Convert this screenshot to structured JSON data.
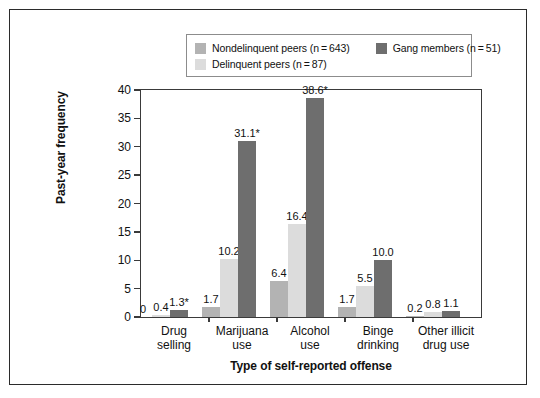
{
  "figure": {
    "border_color": "#2b2b2b",
    "background": "#ffffff"
  },
  "legend": {
    "position": "top-center",
    "entries": [
      {
        "label": "Nondelinquent peers (n = 643)",
        "name": "Nondelinquent peers",
        "n": 643,
        "color": "#b3b3b3"
      },
      {
        "label": "Delinquent peers (n = 87)",
        "name": "Delinquent peers",
        "n": 87,
        "color": "#dcdcdc"
      },
      {
        "label": "Gang members (n = 51)",
        "name": "Gang members",
        "n": 51,
        "color": "#6e6e6e"
      }
    ]
  },
  "chart_data": {
    "type": "bar",
    "title": "",
    "xlabel": "Type of self-reported offense",
    "ylabel": "Past-year frequency",
    "ylim": [
      0,
      40
    ],
    "yticks": [
      0,
      5,
      10,
      15,
      20,
      25,
      30,
      35,
      40
    ],
    "ytick_labels": [
      "0",
      "5",
      "10",
      "15",
      "20",
      "25",
      "30",
      "35",
      "40"
    ],
    "grid": false,
    "legend_position": "top-center",
    "categories": [
      "Drug selling",
      "Marijuana use",
      "Alcohol use",
      "Binge drinking",
      "Other illicit drug use"
    ],
    "category_lines": [
      [
        "Drug",
        "selling"
      ],
      [
        "Marijuana",
        "use"
      ],
      [
        "Alcohol",
        "use"
      ],
      [
        "Binge",
        "drinking"
      ],
      [
        "Other illicit",
        "drug use"
      ]
    ],
    "series": [
      {
        "name": "Nondelinquent peers",
        "color": "#b3b3b3",
        "values": [
          0,
          1.7,
          6.4,
          1.7,
          0.2
        ],
        "labels": [
          "0",
          "1.7",
          "6.4",
          "1.7",
          "0.2"
        ]
      },
      {
        "name": "Delinquent peers",
        "color": "#dcdcdc",
        "values": [
          0.4,
          10.2,
          16.4,
          5.5,
          0.8
        ],
        "labels": [
          "0.4",
          "10.2",
          "16.4",
          "5.5",
          "0.8"
        ]
      },
      {
        "name": "Gang members",
        "color": "#6e6e6e",
        "values": [
          1.3,
          31.1,
          38.6,
          10.0,
          1.1
        ],
        "labels": [
          "1.3*",
          "31.1*",
          "38.6*",
          "10.0",
          "1.1"
        ]
      }
    ],
    "annotations": [
      "* indicates statistically significant difference"
    ]
  }
}
